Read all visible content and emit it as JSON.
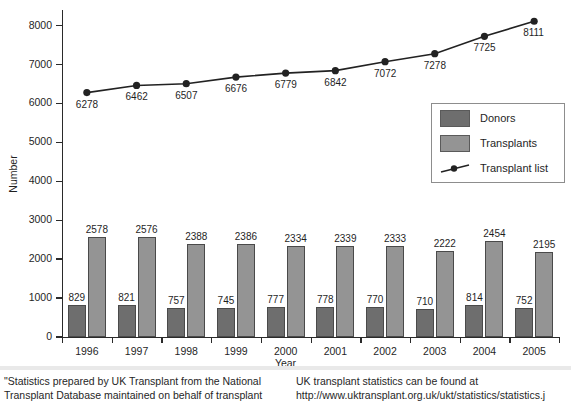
{
  "chart_data": {
    "type": "bar",
    "title": "",
    "xlabel": "Year",
    "ylabel": "Number",
    "ylim": [
      0,
      8400
    ],
    "yticks": [
      0,
      1000,
      2000,
      3000,
      4000,
      5000,
      6000,
      7000,
      8000
    ],
    "grid": false,
    "legend_position": "inside-right",
    "categories": [
      "1996",
      "1997",
      "1998",
      "1999",
      "2000",
      "2001",
      "2002",
      "2003",
      "2004",
      "2005"
    ],
    "series": [
      {
        "name": "Donors",
        "type": "bar",
        "color": "#6e6e6e",
        "values": [
          829,
          821,
          757,
          745,
          777,
          778,
          770,
          710,
          814,
          752
        ]
      },
      {
        "name": "Transplants",
        "type": "bar",
        "color": "#949494",
        "values": [
          2578,
          2576,
          2388,
          2386,
          2334,
          2339,
          2333,
          2222,
          2454,
          2195
        ]
      },
      {
        "name": "Transplant list",
        "type": "line",
        "color": "#222222",
        "values": [
          6278,
          6462,
          6507,
          6676,
          6779,
          6842,
          7072,
          7278,
          7725,
          8111
        ]
      }
    ]
  },
  "legend": {
    "items": [
      {
        "label": "Donors",
        "kind": "swatch-dark"
      },
      {
        "label": "Transplants",
        "kind": "swatch-light"
      },
      {
        "label": "Transplant list",
        "kind": "line-marker"
      }
    ]
  },
  "footer": {
    "left_lines": [
      "\"Statistics prepared by UK Transplant from the National",
      "Transplant Database maintained on behalf of transplant"
    ],
    "right_lines": [
      "UK transplant statistics can be found at",
      "http://www.uktransplant.org.uk/ukt/statistics/statistics.j"
    ]
  }
}
